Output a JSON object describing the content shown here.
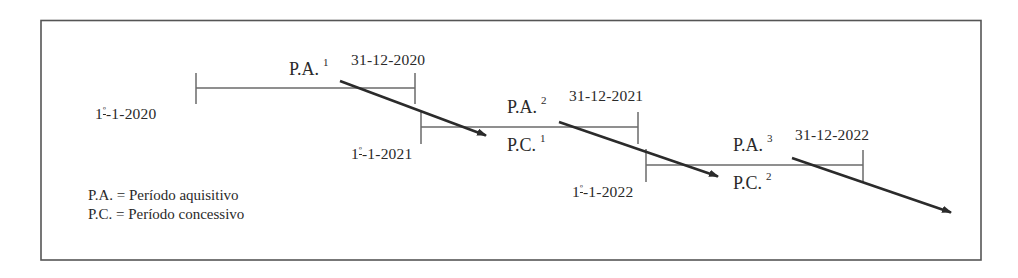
{
  "diagram": {
    "frame": {
      "x": 41,
      "y": 20,
      "width": 940,
      "height": 240,
      "stroke": "#555555"
    },
    "colors": {
      "timeline": "#6a6a6a",
      "arrow": "#2b2b2b",
      "text": "#2a2a2a"
    },
    "segments": [
      {
        "id": "segment-2020",
        "start_date": {
          "day": "1",
          "ordinal": "º",
          "rest": "-1-2020"
        },
        "end_date": "31-12-2020",
        "line": {
          "x1": 196,
          "x2": 415,
          "y": 88,
          "tick_top": 73,
          "tick_bottom": 104
        },
        "labels": [
          {
            "abbr": "P.A.",
            "index": "1",
            "x": 289,
            "y": 60
          }
        ]
      },
      {
        "id": "segment-2021",
        "start_date": {
          "day": "1",
          "ordinal": "º",
          "rest": "-1-2021"
        },
        "end_date": "31-12-2021",
        "line": {
          "x1": 421,
          "x2": 638,
          "y": 127,
          "tick_top": 111,
          "tick_bottom": 144
        },
        "labels": [
          {
            "abbr": "P.A.",
            "index": "2",
            "x": 507,
            "y": 98
          },
          {
            "abbr": "P.C.",
            "index": "1",
            "x": 507,
            "y": 136
          }
        ]
      },
      {
        "id": "segment-2022",
        "start_date": {
          "day": "1",
          "ordinal": "º",
          "rest": "-1-2022"
        },
        "end_date": "31-12-2022",
        "line": {
          "x1": 646,
          "x2": 863,
          "y": 165,
          "tick_top": 149,
          "tick_bottom": 182
        },
        "labels": [
          {
            "abbr": "P.A.",
            "index": "3",
            "x": 733,
            "y": 136
          },
          {
            "abbr": "P.C.",
            "index": "2",
            "x": 733,
            "y": 174
          }
        ]
      }
    ],
    "arrows": [
      {
        "from": [
          340,
          81
        ],
        "to": [
          490,
          137
        ]
      },
      {
        "from": [
          559,
          122
        ],
        "to": [
          722,
          178
        ]
      },
      {
        "from": [
          792,
          158
        ],
        "to": [
          955,
          214
        ]
      }
    ],
    "legend": [
      {
        "abbr": "P.A.",
        "meaning": "Período aquisitivo"
      },
      {
        "abbr": "P.C.",
        "meaning": "Período concessivo"
      }
    ]
  },
  "labels": {
    "start_2020": {
      "day": "1",
      "ordinal": "º",
      "rest": "-1-2020"
    },
    "start_2021": {
      "day": "1",
      "ordinal": "º",
      "rest": "-1-2021"
    },
    "start_2022": {
      "day": "1",
      "ordinal": "º",
      "rest": "-1-2022"
    },
    "end_2020": "31-12-2020",
    "end_2021": "31-12-2021",
    "end_2022": "31-12-2022",
    "pa1": {
      "abbr": "P.A.",
      "index": "1"
    },
    "pa2": {
      "abbr": "P.A.",
      "index": "2"
    },
    "pa3": {
      "abbr": "P.A.",
      "index": "3"
    },
    "pc1": {
      "abbr": "P.C.",
      "index": "1"
    },
    "pc2": {
      "abbr": "P.C.",
      "index": "2"
    },
    "legend_pa": "P.A. = Período aquisitivo",
    "legend_pc": "P.C. = Período concessivo"
  }
}
